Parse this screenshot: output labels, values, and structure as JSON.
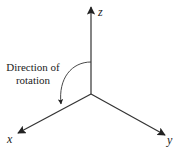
{
  "diagram": {
    "type": "3d-coordinate-axes",
    "axes": {
      "z": {
        "label": "z"
      },
      "x": {
        "label": "x"
      },
      "y": {
        "label": "y"
      }
    },
    "annotation": {
      "line1": "Direction of",
      "line2": "rotation"
    },
    "colors": {
      "stroke": "#333333",
      "text": "#222222",
      "background": "#ffffff"
    }
  }
}
